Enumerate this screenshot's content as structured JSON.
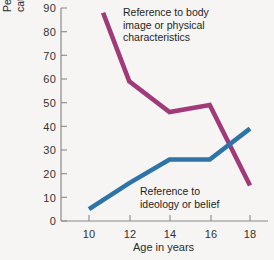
{
  "chart_data": {
    "type": "line",
    "title": "",
    "xlabel": "Age in years",
    "ylabel": "Percentage of respondents who used a category of self-definition at least once",
    "ylabel_line1": "Percentage of respondents who used a",
    "ylabel_line2": "category of self-definition at least once",
    "x": [
      10,
      11,
      12,
      14,
      16,
      18
    ],
    "xlim": [
      9.3,
      18.6
    ],
    "ylim": [
      0,
      90
    ],
    "xticks": [
      10,
      12,
      14,
      16,
      18
    ],
    "yticks": [
      0,
      10,
      20,
      30,
      40,
      50,
      60,
      70,
      80,
      90
    ],
    "grid": false,
    "legend_position": "inline-annotations",
    "series": [
      {
        "name": "Reference to body image or physical characteristics",
        "color": "#A03A78",
        "x": [
          10.7,
          12,
          14,
          16,
          18
        ],
        "values": [
          88,
          59,
          46,
          49,
          15
        ]
      },
      {
        "name": "Reference to ideology or belief",
        "color": "#2E74A8",
        "x": [
          10,
          12,
          14,
          16,
          18
        ],
        "values": [
          5,
          16,
          26,
          26,
          39
        ]
      }
    ],
    "annotations": [
      {
        "id": "annot-body",
        "text": "Reference to body\nimage or physical\ncharacteristics",
        "series": "Reference to body image or physical characteristics"
      },
      {
        "id": "annot-ideo",
        "text": "Reference to\nideology or belief",
        "series": "Reference to ideology or belief"
      }
    ]
  },
  "axis": {
    "y_tick_labels": [
      "90",
      "80",
      "70",
      "60",
      "50",
      "40",
      "30",
      "20",
      "10",
      "0"
    ],
    "x_tick_labels": [
      "10",
      "12",
      "14",
      "16",
      "18"
    ],
    "x_axis_title": "Age in years"
  },
  "colors": {
    "background": "#f6f5f3",
    "axis": "#8a8a8a",
    "magenta_series": "#A03A78",
    "blue_series": "#2E74A8",
    "text": "#2b2b2b"
  }
}
